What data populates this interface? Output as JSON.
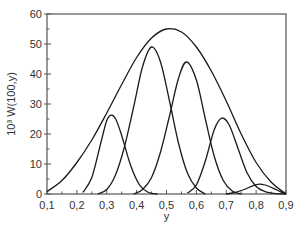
{
  "chart_data": {
    "type": "line",
    "title": "",
    "xlabel": "y",
    "ylabel": "10³ W(100,y)",
    "xlim": [
      0.1,
      0.9
    ],
    "ylim": [
      0,
      60
    ],
    "grid": false,
    "legend": null,
    "x_ticks": [
      "0,1",
      "0,2",
      "0,3",
      "0,4",
      "0,5",
      "0,6",
      "0,7",
      "0,8",
      "0,9"
    ],
    "x_tick_values": [
      0.1,
      0.2,
      0.3,
      0.4,
      0.5,
      0.6,
      0.7,
      0.8,
      0.9
    ],
    "x_minor_step": 0.05,
    "y_ticks": [
      "0",
      "10",
      "20",
      "30",
      "40",
      "50",
      "60"
    ],
    "y_tick_values": [
      0,
      10,
      20,
      30,
      40,
      50,
      60
    ],
    "y_minor_step": 5,
    "series": [
      {
        "name": "envelope",
        "x": [
          0.1,
          0.15,
          0.2,
          0.25,
          0.3,
          0.35,
          0.4,
          0.45,
          0.5,
          0.55,
          0.6,
          0.65,
          0.7,
          0.75,
          0.8,
          0.85,
          0.9
        ],
        "values": [
          0.8,
          4.5,
          10.5,
          18.0,
          27.0,
          36.5,
          45.5,
          52.0,
          55.0,
          54.0,
          49.0,
          41.0,
          31.0,
          20.0,
          10.5,
          4.0,
          0.0
        ]
      },
      {
        "name": "peak-1",
        "x": [
          0.22,
          0.25,
          0.28,
          0.3,
          0.315,
          0.33,
          0.35,
          0.38,
          0.41,
          0.44,
          0.47
        ],
        "values": [
          0.5,
          5.5,
          17.0,
          24.5,
          26.3,
          25.0,
          19.5,
          9.5,
          3.0,
          0.5,
          0.0
        ]
      },
      {
        "name": "peak-2",
        "x": [
          0.27,
          0.3,
          0.33,
          0.36,
          0.39,
          0.42,
          0.45,
          0.48,
          0.51,
          0.54,
          0.57,
          0.6,
          0.63
        ],
        "values": [
          0.0,
          1.5,
          6.5,
          16.0,
          29.0,
          42.5,
          49.0,
          44.0,
          31.0,
          17.0,
          7.0,
          2.0,
          0.0
        ]
      },
      {
        "name": "peak-3",
        "x": [
          0.39,
          0.42,
          0.45,
          0.48,
          0.51,
          0.54,
          0.567,
          0.6,
          0.63,
          0.66,
          0.69,
          0.72,
          0.75
        ],
        "values": [
          0.0,
          1.5,
          5.5,
          14.0,
          26.0,
          38.5,
          44.0,
          38.0,
          25.0,
          12.5,
          4.5,
          1.0,
          0.0
        ]
      },
      {
        "name": "peak-4",
        "x": [
          0.57,
          0.6,
          0.63,
          0.66,
          0.685,
          0.71,
          0.74,
          0.77,
          0.8,
          0.83,
          0.86,
          0.9
        ],
        "values": [
          0.3,
          3.0,
          11.0,
          21.5,
          25.3,
          23.0,
          15.0,
          7.0,
          2.5,
          0.8,
          0.2,
          0.0
        ]
      },
      {
        "name": "peak-5",
        "x": [
          0.7,
          0.73,
          0.76,
          0.79,
          0.81,
          0.83,
          0.86,
          0.88,
          0.9
        ],
        "values": [
          0.0,
          0.5,
          1.5,
          2.8,
          3.3,
          3.0,
          1.8,
          0.8,
          0.0
        ]
      }
    ]
  },
  "plot_area": {
    "left": 47,
    "top": 14,
    "right": 286,
    "bottom": 194
  }
}
